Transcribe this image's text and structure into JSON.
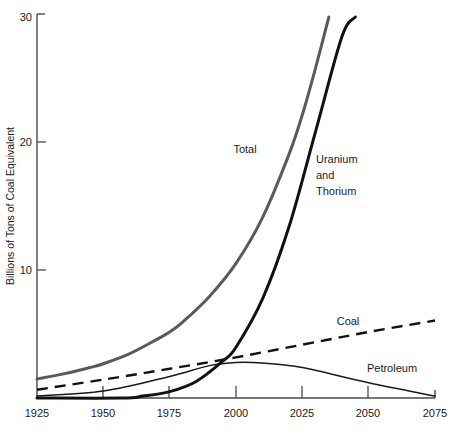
{
  "chart_data": {
    "type": "line",
    "title": "",
    "subtitle": "",
    "xlabel": "",
    "ylabel": "Billions of Tons of Coal Equivalent",
    "xlim": [
      1925,
      2075
    ],
    "ylim": [
      0,
      30
    ],
    "grid": false,
    "legend_position": "inline-annotations",
    "x_ticks": [
      "1925",
      "1950",
      "1975",
      "2000",
      "2025",
      "2050",
      "2075"
    ],
    "x_tick_values": [
      1925,
      1950,
      1975,
      2000,
      2025,
      2050,
      2075
    ],
    "y_ticks": [
      "10",
      "20",
      "30"
    ],
    "y_tick_values": [
      10,
      20,
      30
    ],
    "series": [
      {
        "name": "Total",
        "style": "solid-thick-gray",
        "color": "#5a5a5a",
        "x": [
          1925,
          1935,
          1945,
          1950,
          1960,
          1970,
          1975,
          1980,
          1990,
          2000,
          2010,
          2020,
          2025,
          2030,
          2035
        ],
        "values": [
          1.5,
          1.9,
          2.4,
          2.7,
          3.5,
          4.6,
          5.2,
          6.0,
          8.0,
          10.6,
          14.2,
          19.2,
          22.3,
          26.0,
          30.0
        ]
      },
      {
        "name": "Uranium and Thorium",
        "style": "solid-thick-black",
        "color": "#111111",
        "x": [
          1925,
          1957,
          1965,
          1975,
          1985,
          1995,
          2000,
          2010,
          2020,
          2030,
          2040,
          2045
        ],
        "values": [
          0.0,
          0.0,
          0.15,
          0.5,
          1.3,
          2.9,
          4.0,
          7.8,
          13.5,
          21.0,
          28.5,
          30.0
        ]
      },
      {
        "name": "Coal",
        "style": "dashed-black",
        "color": "#111111",
        "x": [
          1925,
          1950,
          1975,
          2000,
          2025,
          2050,
          2075
        ],
        "values": [
          0.65,
          1.45,
          2.3,
          3.2,
          4.2,
          5.2,
          6.1
        ]
      },
      {
        "name": "Petroleum",
        "style": "solid-thin-black",
        "color": "#1a1a1a",
        "x": [
          1925,
          1950,
          1975,
          1990,
          2000,
          2010,
          2025,
          2050,
          2075
        ],
        "values": [
          0.15,
          0.55,
          1.7,
          2.55,
          2.8,
          2.75,
          2.4,
          1.2,
          0.15
        ]
      }
    ],
    "annotations": [
      {
        "text": "Total",
        "x": 1973,
        "y": 19.0
      },
      {
        "text": "Uranium",
        "x": 2008,
        "y": 18.0
      },
      {
        "text": "and",
        "x": 2008,
        "y": 16.7
      },
      {
        "text": "Thorium",
        "x": 2008,
        "y": 15.4
      },
      {
        "text": "Coal",
        "x": 2030,
        "y": 6.6
      },
      {
        "text": "Petroleum",
        "x": 2040,
        "y": 3.1
      }
    ]
  },
  "axes": {
    "y_label": "Billions of Tons of Coal Equivalent",
    "y_tick_30": "30",
    "y_tick_20": "20",
    "y_tick_10": "10",
    "x_tick_1925": "1925",
    "x_tick_1950": "1950",
    "x_tick_1975": "1975",
    "x_tick_2000": "2000",
    "x_tick_2025": "2025",
    "x_tick_2050": "2050",
    "x_tick_2075": "2075"
  },
  "labels": {
    "total": "Total",
    "uranium_line1": "Uranium",
    "uranium_line2": "and",
    "uranium_line3": "Thorium",
    "coal": "Coal",
    "petroleum": "Petroleum"
  },
  "colors": {
    "total": "#5a5a5a",
    "uranium": "#111111",
    "coal": "#111111",
    "petroleum": "#1a1a1a",
    "axis": "#4a4a4a",
    "background": "#ffffff"
  }
}
